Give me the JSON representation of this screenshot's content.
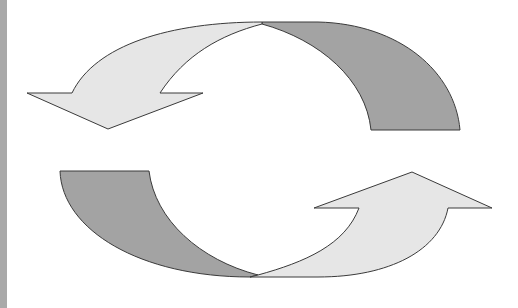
{
  "diagram": {
    "type": "cycle-arrows",
    "colors": {
      "background": "#ffffff",
      "left_bar": "#a9a9a9",
      "arrow_light": "#e6e6e6",
      "arrow_dark": "#a3a3a3",
      "stroke": "#3a3a3a"
    },
    "arrows": [
      {
        "id": "top-arrow",
        "direction": "counter-clockwise, pointing down-left",
        "tail_color": "dark",
        "head_color": "light"
      },
      {
        "id": "bottom-arrow",
        "direction": "counter-clockwise, pointing up-right",
        "tail_color": "dark",
        "head_color": "light"
      }
    ]
  }
}
